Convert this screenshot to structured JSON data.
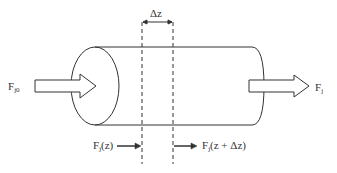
{
  "diagram": {
    "type": "tubular reactor differential volume element",
    "labels": {
      "delta_z": "Δz",
      "inlet_flow_main": "F",
      "inlet_flow_sub": "j0",
      "outlet_flow_main": "F",
      "outlet_flow_sub": "j",
      "flow_in_z_main": "F",
      "flow_in_z_sub": "j",
      "flow_in_z_arg": "(z)",
      "flow_out_z_main": "F",
      "flow_out_z_sub": "j",
      "flow_out_z_arg": "(z + Δz)"
    },
    "colors": {
      "stroke": "#333333",
      "background": "#ffffff"
    }
  }
}
